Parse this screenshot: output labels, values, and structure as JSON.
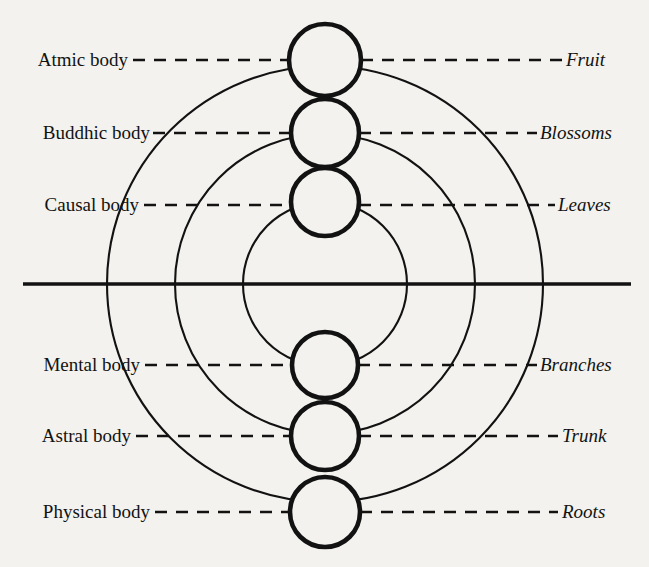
{
  "diagram": {
    "background_color": "#f3f2ee",
    "ink_color": "#121212",
    "axis": {
      "name": "horizontal-divider",
      "y": 284,
      "x_start": 23,
      "x_end": 631
    },
    "center_x": 325,
    "rows": [
      {
        "index": 0,
        "left_label": "Atmic body",
        "right_label": "Fruit",
        "circle": {
          "cx": 325,
          "cy": 60,
          "r": 36
        },
        "label_y": 60,
        "left_label_right_edge": 128,
        "right_label_left_edge": 566,
        "dash_left_start": 133,
        "dash_left_end": 289,
        "dash_right_start": 361,
        "dash_right_end": 562
      },
      {
        "index": 1,
        "left_label": "Buddhic body",
        "right_label": "Blossoms",
        "circle": {
          "cx": 325,
          "cy": 133,
          "r": 34
        },
        "label_y": 133,
        "left_label_right_edge": 150,
        "right_label_left_edge": 540,
        "dash_left_start": 153,
        "dash_left_end": 291,
        "dash_right_start": 359,
        "dash_right_end": 537
      },
      {
        "index": 2,
        "left_label": "Causal body",
        "right_label": "Leaves",
        "circle": {
          "cx": 325,
          "cy": 202,
          "r": 34
        },
        "label_y": 205,
        "left_label_right_edge": 139,
        "right_label_left_edge": 558,
        "dash_left_start": 144,
        "dash_left_end": 291,
        "dash_right_start": 359,
        "dash_right_end": 555
      },
      {
        "index": 3,
        "left_label": "Mental body",
        "right_label": "Branches",
        "circle": {
          "cx": 325,
          "cy": 365,
          "r": 33
        },
        "label_y": 365,
        "left_label_right_edge": 140,
        "right_label_left_edge": 540,
        "dash_left_start": 145,
        "dash_left_end": 292,
        "dash_right_start": 358,
        "dash_right_end": 537
      },
      {
        "index": 4,
        "left_label": "Astral body",
        "right_label": "Trunk",
        "circle": {
          "cx": 325,
          "cy": 436,
          "r": 34
        },
        "label_y": 436,
        "left_label_right_edge": 131,
        "right_label_left_edge": 562,
        "dash_left_start": 136,
        "dash_left_end": 291,
        "dash_right_start": 359,
        "dash_right_end": 558
      },
      {
        "index": 5,
        "left_label": "Physical body",
        "right_label": "Roots",
        "circle": {
          "cx": 325,
          "cy": 512,
          "r": 35
        },
        "label_y": 512,
        "left_label_right_edge": 150,
        "right_label_left_edge": 562,
        "dash_left_start": 155,
        "dash_left_end": 290,
        "dash_right_start": 360,
        "dash_right_end": 558
      }
    ],
    "arcs": [
      {
        "name": "outer-arc",
        "cx": 325,
        "cy": 284,
        "r": 218
      },
      {
        "name": "middle-arc",
        "cx": 325,
        "cy": 284,
        "r": 150
      },
      {
        "name": "inner-arc",
        "cx": 325,
        "cy": 284,
        "r": 82
      }
    ]
  }
}
